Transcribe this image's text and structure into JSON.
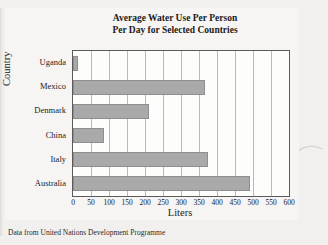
{
  "scan": {
    "top_fragment": "",
    "curve_icon": "pencil-curve-mark"
  },
  "chart_data": {
    "type": "bar",
    "orientation": "horizontal",
    "title": "Average Water Use Per Person Per Day for Selected Countries",
    "title_lines": [
      "Average Water Use Per Person",
      "Per Day for Selected Countries"
    ],
    "categories": [
      "Uganda",
      "Mexico",
      "Denmark",
      "China",
      "Italy",
      "Australia"
    ],
    "values": [
      15,
      366,
      211,
      86,
      376,
      493
    ],
    "xlabel": "Liters",
    "ylabel": "Country",
    "xlim": [
      0,
      600
    ],
    "xticks": [
      0,
      50,
      100,
      150,
      200,
      250,
      300,
      350,
      400,
      450,
      500,
      550,
      600
    ],
    "xtick_labels": [
      "0",
      "50",
      "100",
      "150",
      "200",
      "250",
      "300",
      "350",
      "400",
      "450",
      "500",
      "550",
      "600"
    ],
    "grid": "vertical",
    "legend": "none",
    "bar_color": "#a9a9a9",
    "bar_border_color": "#8e8e8e",
    "plot_background": "#fdfdfc",
    "figure_background": "#f6f5f3"
  },
  "caption": {
    "source_note": "Data from United Nations Development Programme"
  }
}
